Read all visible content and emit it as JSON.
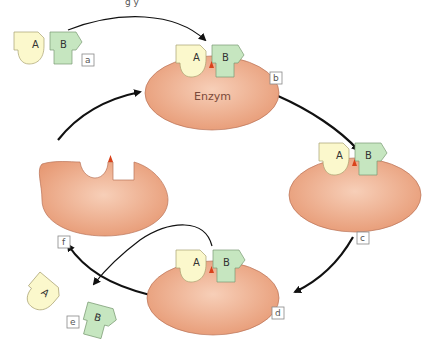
{
  "diagram": {
    "title_fragment": "g            y",
    "enzyme_label": "Enzym",
    "substrate_a": "A",
    "substrate_b": "B",
    "steps": [
      {
        "id": "a",
        "label": "a"
      },
      {
        "id": "b",
        "label": "b"
      },
      {
        "id": "c",
        "label": "c"
      },
      {
        "id": "d",
        "label": "d"
      },
      {
        "id": "e",
        "label": "e"
      },
      {
        "id": "f",
        "label": "f"
      }
    ],
    "colors": {
      "enzyme_fill": "#eba482",
      "enzyme_center": "#f7cdb5",
      "enzyme_stroke": "#b97358",
      "substrate_a_fill": "#fbf8cc",
      "substrate_b_fill": "#c6e6c0",
      "active_site": "#d9421b",
      "arrow": "#111111"
    }
  }
}
